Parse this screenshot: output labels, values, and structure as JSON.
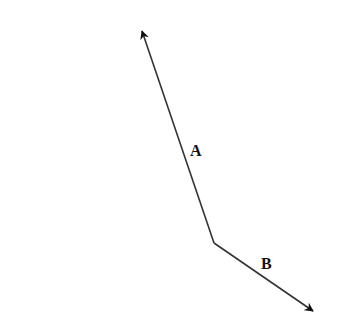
{
  "diagram": {
    "type": "vector-diagram",
    "line_color": "#333333",
    "label_color": "#111111",
    "vertex": {
      "x": 214,
      "y": 243
    },
    "vectors": [
      {
        "label": "A",
        "from": {
          "x": 214,
          "y": 243
        },
        "to": {
          "x": 142,
          "y": 31
        },
        "label_pos": {
          "x": 190,
          "y": 156
        }
      },
      {
        "label": "B",
        "from": {
          "x": 214,
          "y": 243
        },
        "to": {
          "x": 313,
          "y": 311
        },
        "label_pos": {
          "x": 261,
          "y": 269
        }
      }
    ]
  }
}
